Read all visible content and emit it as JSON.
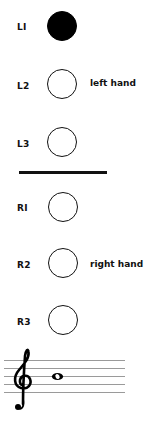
{
  "diagram": {
    "type": "woodwind fingering chart",
    "left_hand": {
      "label": "left hand",
      "holes": [
        {
          "id": "L1",
          "label": "LI",
          "state": "closed"
        },
        {
          "id": "L2",
          "label": "L2",
          "state": "open"
        },
        {
          "id": "L3",
          "label": "L3",
          "state": "open"
        }
      ]
    },
    "right_hand": {
      "label": "right hand",
      "holes": [
        {
          "id": "R1",
          "label": "RI",
          "state": "open"
        },
        {
          "id": "R2",
          "label": "R2",
          "state": "open"
        },
        {
          "id": "R3",
          "label": "R3",
          "state": "open"
        }
      ]
    },
    "staff": {
      "clef": "treble",
      "clef_glyph": "𝄞",
      "note": {
        "pitch": "B4",
        "duration": "whole",
        "position": "middle line"
      }
    },
    "colors": {
      "ink": "#111111",
      "closed_hole": "#000000",
      "open_hole": "#ffffff",
      "staff_lines": "#9a9a9a",
      "background": "#ffffff"
    }
  }
}
